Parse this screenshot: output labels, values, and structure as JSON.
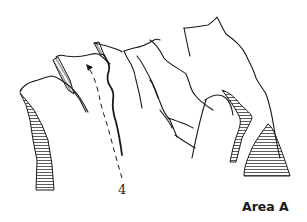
{
  "diagram": {
    "type": "topo-sketch",
    "route_label": "4",
    "area_label": "Area A",
    "ink_color": "#1a1a1a",
    "background_color": "#ffffff"
  }
}
